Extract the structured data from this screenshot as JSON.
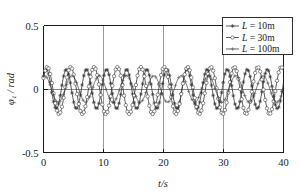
{
  "chart_data": {
    "type": "line",
    "title": "",
    "xlabel": "t/s",
    "ylabel": "φ₁ / rad",
    "xlim": [
      0,
      40
    ],
    "ylim": [
      -0.5,
      0.5
    ],
    "xticks": [
      "0",
      "10",
      "20",
      "30",
      "40"
    ],
    "xtick_values": [
      0,
      10,
      20,
      30,
      40
    ],
    "yticks": [
      "0.5",
      "0",
      "-0.5"
    ],
    "ytick_values": [
      0.5,
      0,
      -0.5
    ],
    "grid": "vertical gridlines at t = 10, 20, 30; horizontal zero line at phi = 0",
    "legend_position": "top-right inside axes",
    "series": [
      {
        "name": "L = 10m",
        "legend_label": "L = 10m",
        "marker": "star",
        "amplitude": 0.155,
        "period": 3.35,
        "phase_deg": 40,
        "offset": 0.0,
        "description": "highest frequency oscillation, amplitude about 0.16 rad"
      },
      {
        "name": "L = 30m",
        "legend_label": "L = 30m",
        "marker": "open-circle",
        "amplitude": 0.185,
        "period": 3.9,
        "phase_deg": 32,
        "offset": -0.012,
        "description": "mid frequency oscillation, largest amplitude about 0.19 rad"
      },
      {
        "name": "L = 100m",
        "legend_label": "L = 100m",
        "marker": "plus",
        "amplitude": 0.105,
        "period": 4.55,
        "phase_deg": 75,
        "offset": 0.0,
        "description": "lowest frequency oscillation, smallest amplitude about 0.10 rad"
      }
    ],
    "colors": {
      "curve": "#333333",
      "axis": "#1a1a1a",
      "grid": "#7a7a7a",
      "background": "#ffffff"
    }
  }
}
